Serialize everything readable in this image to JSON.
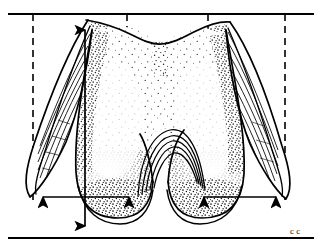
{
  "figure": {
    "caption_mark": "c c",
    "ink_color": "#000000",
    "background_color": "#ffffff",
    "stipple_color": "#1a1a1a"
  },
  "reference_lines": {
    "top_line_label": "superior reference line",
    "bottom_line_label": "inferior reference line",
    "dashed_label": "vertical reference line",
    "top_y": 14,
    "bottom_y": 238,
    "dashed_x": [
      33,
      127,
      208,
      285
    ]
  },
  "measurements": [
    {
      "name": "vertical-height-arrow",
      "orientation": "vertical",
      "x": 85,
      "y1": 18,
      "y2": 237
    },
    {
      "name": "left-condyle-width-arrow",
      "orientation": "horizontal",
      "y": 197,
      "x1": 31,
      "x2": 140
    },
    {
      "name": "right-condyle-width-arrow",
      "orientation": "horizontal",
      "y": 197,
      "x1": 192,
      "x2": 287
    }
  ],
  "structures": [
    {
      "name": "left-epicondyle-flange",
      "style": "hatched"
    },
    {
      "name": "right-epicondyle-flange",
      "style": "streaked"
    },
    {
      "name": "left-condyle",
      "style": "stippled"
    },
    {
      "name": "right-condyle",
      "style": "stippled"
    },
    {
      "name": "intercondylar-notch",
      "style": "arc-lines"
    },
    {
      "name": "shaft-body",
      "style": "dense-stipple"
    }
  ]
}
